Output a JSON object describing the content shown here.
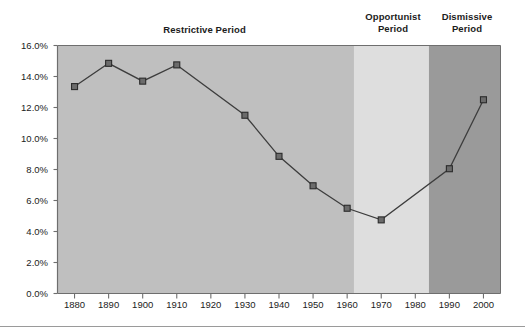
{
  "chart_data": {
    "type": "line",
    "title": "",
    "xlabel": "",
    "ylabel": "",
    "x": [
      1880,
      1890,
      1900,
      1910,
      1930,
      1940,
      1950,
      1960,
      1970,
      1990,
      2000
    ],
    "values": [
      13.35,
      14.85,
      13.7,
      14.75,
      11.5,
      8.85,
      6.95,
      5.5,
      4.75,
      8.05,
      12.5
    ],
    "value_unit": "%",
    "xlim": [
      1875,
      2005
    ],
    "ylim": [
      0.0,
      16.0
    ],
    "grid": false,
    "legend": null,
    "marker": "square",
    "xticks": [
      "1880",
      "1890",
      "1900",
      "1910",
      "1920",
      "1930",
      "1940",
      "1950",
      "1960",
      "1970",
      "1980",
      "1990",
      "2000"
    ],
    "xtick_values": [
      1880,
      1890,
      1900,
      1910,
      1920,
      1930,
      1940,
      1950,
      1960,
      1970,
      1980,
      1990,
      2000
    ],
    "yticks": [
      "0.0%",
      "2.0%",
      "4.0%",
      "6.0%",
      "8.0%",
      "10.0%",
      "12.0%",
      "14.0%",
      "16.0%"
    ],
    "ytick_values": [
      0,
      2,
      4,
      6,
      8,
      10,
      12,
      14,
      16
    ],
    "bands": [
      {
        "name": "restrictive",
        "label": "Restrictive Period",
        "x_start": 1875,
        "x_end": 1962,
        "color": "#bfbfbf"
      },
      {
        "name": "opportunist",
        "label": "Opportunist\nPeriod",
        "x_start": 1962,
        "x_end": 1984,
        "color": "#dedede"
      },
      {
        "name": "dismissive",
        "label": "Dismissive\nPeriod",
        "x_start": 1984,
        "x_end": 2005,
        "color": "#9a9a9a"
      }
    ],
    "line_color": "#3d3d3d",
    "marker_color": "#6b6b6b",
    "marker_edge_color": "#2b2b2b",
    "axis_color": "#6e6e6e",
    "text_color": "#1c1c1c"
  }
}
